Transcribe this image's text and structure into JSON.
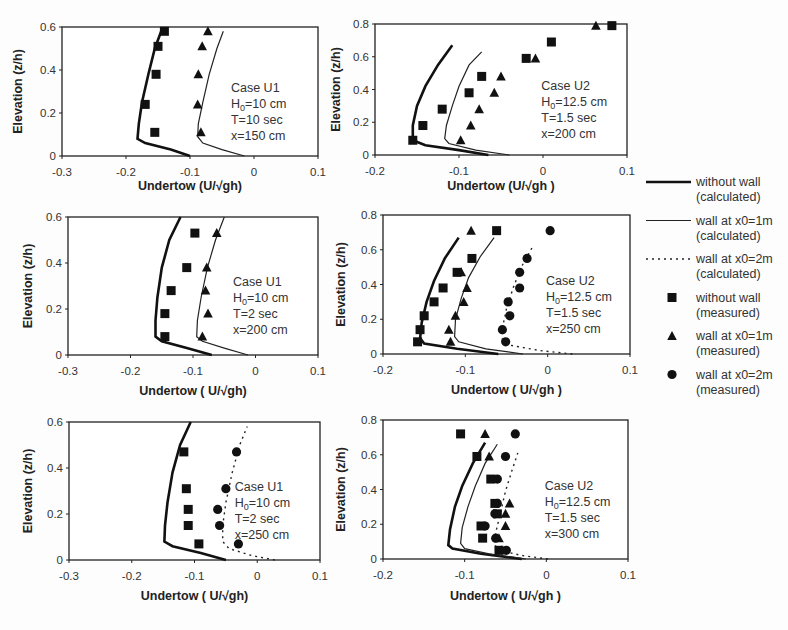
{
  "legend": {
    "items": [
      {
        "label1": "without wall",
        "label2": "(calculated)",
        "style": "thick-line"
      },
      {
        "label1": "wall at x0=1m",
        "label2": "(calculated)",
        "style": "thin-line"
      },
      {
        "label1": "wall at x0=2m",
        "label2": "(calculated)",
        "style": "dotted-line"
      },
      {
        "label1": "without wall",
        "label2": "(measured)",
        "style": "square"
      },
      {
        "label1": "wall at x0=1m",
        "label2": "(measured)",
        "style": "triangle"
      },
      {
        "label1": "wall at x0=2m",
        "label2": "(measured)",
        "style": "circle"
      }
    ]
  },
  "chart_data": [
    {
      "type": "scatter",
      "title": "",
      "annotation": [
        "Case U1",
        "H0=10 cm",
        "T=10 sec",
        "x=150 cm"
      ],
      "xlabel": "Undertow (U/√gh)",
      "ylabel": "Elevation (z/h)",
      "xlim": [
        -0.3,
        0.1
      ],
      "ylim": [
        0,
        0.6
      ],
      "xticks": [
        "-0.3",
        "-0.2",
        "-0.1",
        "0",
        "0.1"
      ],
      "yticks": [
        "0",
        "0.2",
        "0.4",
        "0.6"
      ],
      "series": [
        {
          "name": "without wall (calculated)",
          "style": "thick-line",
          "x": [
            -0.1,
            -0.13,
            -0.17,
            -0.182,
            -0.18,
            -0.175,
            -0.165,
            -0.155,
            -0.145
          ],
          "y": [
            0,
            0.03,
            0.06,
            0.08,
            0.15,
            0.25,
            0.38,
            0.5,
            0.58
          ]
        },
        {
          "name": "wall at x0=1m (calculated)",
          "style": "thin-line",
          "x": [
            -0.015,
            -0.05,
            -0.08,
            -0.088,
            -0.087,
            -0.08,
            -0.07,
            -0.058,
            -0.048
          ],
          "y": [
            0,
            0.03,
            0.06,
            0.09,
            0.15,
            0.25,
            0.38,
            0.5,
            0.58
          ]
        },
        {
          "name": "without wall (measured)",
          "style": "square",
          "x": [
            -0.155,
            -0.17,
            -0.153,
            -0.15,
            -0.14
          ],
          "y": [
            0.11,
            0.24,
            0.38,
            0.51,
            0.58
          ]
        },
        {
          "name": "wall at x0=1m (measured)",
          "style": "triangle",
          "x": [
            -0.083,
            -0.088,
            -0.087,
            -0.081,
            -0.072
          ],
          "y": [
            0.11,
            0.24,
            0.38,
            0.51,
            0.58
          ]
        }
      ]
    },
    {
      "type": "scatter",
      "title": "",
      "annotation": [
        "Case U2",
        "H0=12.5 cm",
        "T=1.5 sec",
        "x=200 cm"
      ],
      "xlabel": "Undertow (U/√gh )",
      "ylabel": "Elevation (z/h)",
      "xlim": [
        -0.2,
        0.1
      ],
      "ylim": [
        0,
        0.8
      ],
      "xticks": [
        "-0.2",
        "-0.1",
        "0",
        "0.1"
      ],
      "yticks": [
        "0",
        "0.2",
        "0.4",
        "0.6",
        "0.8"
      ],
      "series": [
        {
          "name": "without wall (calculated)",
          "style": "thick-line",
          "x": [
            -0.065,
            -0.1,
            -0.14,
            -0.155,
            -0.155,
            -0.15,
            -0.14,
            -0.125,
            -0.108
          ],
          "y": [
            0,
            0.03,
            0.06,
            0.09,
            0.18,
            0.3,
            0.42,
            0.55,
            0.67
          ]
        },
        {
          "name": "wall at x0=1m (calculated)",
          "style": "thin-line",
          "x": [
            -0.04,
            -0.08,
            -0.112,
            -0.117,
            -0.115,
            -0.108,
            -0.1,
            -0.088,
            -0.073
          ],
          "y": [
            0,
            0.03,
            0.07,
            0.1,
            0.18,
            0.3,
            0.42,
            0.55,
            0.63
          ]
        },
        {
          "name": "without wall (measured)",
          "style": "square",
          "x": [
            -0.155,
            -0.143,
            -0.12,
            -0.088,
            -0.073,
            -0.02,
            0.01,
            0.082
          ],
          "y": [
            0.09,
            0.18,
            0.28,
            0.38,
            0.48,
            0.59,
            0.69,
            0.79
          ]
        },
        {
          "name": "wall at x0=1m (measured)",
          "style": "triangle",
          "x": [
            -0.098,
            -0.086,
            -0.076,
            -0.058,
            -0.05,
            -0.009,
            0.063
          ],
          "y": [
            0.09,
            0.18,
            0.28,
            0.38,
            0.48,
            0.59,
            0.79
          ]
        }
      ]
    },
    {
      "type": "scatter",
      "title": "",
      "annotation": [
        "Case U1",
        "H0=10 cm",
        "T=2 sec",
        "x=200 cm"
      ],
      "xlabel": "Undertow ( U/√gh)",
      "ylabel": "Elevation (z/h)",
      "xlim": [
        -0.3,
        0.1
      ],
      "ylim": [
        0,
        0.6
      ],
      "xticks": [
        "-0.3",
        "-0.2",
        "-0.1",
        "0",
        "0.1"
      ],
      "yticks": [
        "0",
        "0.2",
        "0.4",
        "0.6"
      ],
      "series": [
        {
          "name": "without wall (calculated)",
          "style": "thick-line",
          "x": [
            -0.07,
            -0.11,
            -0.15,
            -0.16,
            -0.16,
            -0.157,
            -0.15,
            -0.138,
            -0.12
          ],
          "y": [
            0,
            0.03,
            0.06,
            0.08,
            0.15,
            0.25,
            0.38,
            0.5,
            0.6
          ]
        },
        {
          "name": "wall at x0=1m (calculated)",
          "style": "thin-line",
          "x": [
            -0.012,
            -0.05,
            -0.085,
            -0.094,
            -0.093,
            -0.087,
            -0.077,
            -0.064,
            -0.05
          ],
          "y": [
            0,
            0.03,
            0.06,
            0.08,
            0.15,
            0.25,
            0.38,
            0.5,
            0.6
          ]
        },
        {
          "name": "without wall (measured)",
          "style": "square",
          "x": [
            -0.145,
            -0.145,
            -0.135,
            -0.11,
            -0.097
          ],
          "y": [
            0.08,
            0.18,
            0.28,
            0.38,
            0.53
          ]
        },
        {
          "name": "wall at x0=1m (measured)",
          "style": "triangle",
          "x": [
            -0.085,
            -0.076,
            -0.08,
            -0.078,
            -0.062
          ],
          "y": [
            0.08,
            0.18,
            0.28,
            0.38,
            0.53
          ]
        }
      ]
    },
    {
      "type": "scatter",
      "title": "",
      "annotation": [
        "Case U2",
        "H0=12.5 cm",
        "T=1.5 sec",
        "x=250 cm"
      ],
      "xlabel": "Undertow ( U/√gh )",
      "ylabel": "Elevation (z/h)",
      "xlim": [
        -0.2,
        0.1
      ],
      "ylim": [
        0,
        0.8
      ],
      "xticks": [
        "-0.2",
        "-0.1",
        "0",
        "0.1"
      ],
      "yticks": [
        "0",
        "0.2",
        "0.4",
        "0.6",
        "0.8"
      ],
      "series": [
        {
          "name": "without wall (calculated)",
          "style": "thick-line",
          "x": [
            -0.06,
            -0.11,
            -0.15,
            -0.155,
            -0.153,
            -0.147,
            -0.138,
            -0.125,
            -0.108
          ],
          "y": [
            0,
            0.03,
            0.06,
            0.09,
            0.18,
            0.3,
            0.42,
            0.55,
            0.67
          ]
        },
        {
          "name": "wall at x0=1m (calculated)",
          "style": "thin-line",
          "x": [
            -0.03,
            -0.075,
            -0.108,
            -0.113,
            -0.112,
            -0.105,
            -0.096,
            -0.082,
            -0.065
          ],
          "y": [
            0,
            0.03,
            0.07,
            0.1,
            0.2,
            0.32,
            0.44,
            0.56,
            0.67
          ]
        },
        {
          "name": "wall at x0=2m (calculated)",
          "style": "dotted-line",
          "x": [
            0.03,
            -0.01,
            -0.045,
            -0.055,
            -0.055,
            -0.05,
            -0.042,
            -0.032,
            -0.018
          ],
          "y": [
            0,
            0.02,
            0.05,
            0.08,
            0.15,
            0.26,
            0.38,
            0.5,
            0.62
          ]
        },
        {
          "name": "without wall (measured)",
          "style": "square",
          "x": [
            -0.158,
            -0.155,
            -0.15,
            -0.138,
            -0.127,
            -0.11,
            -0.092,
            -0.062
          ],
          "y": [
            0.07,
            0.14,
            0.22,
            0.3,
            0.38,
            0.47,
            0.55,
            0.71
          ]
        },
        {
          "name": "wall at x0=1m (measured)",
          "style": "triangle",
          "x": [
            -0.118,
            -0.12,
            -0.112,
            -0.102,
            -0.098,
            -0.105,
            -0.093
          ],
          "y": [
            0.07,
            0.14,
            0.22,
            0.3,
            0.38,
            0.47,
            0.71
          ]
        },
        {
          "name": "wall at x0=2m (measured)",
          "style": "circle",
          "x": [
            -0.051,
            -0.055,
            -0.046,
            -0.048,
            -0.034,
            -0.034,
            -0.025,
            0.003
          ],
          "y": [
            0.07,
            0.14,
            0.22,
            0.3,
            0.38,
            0.47,
            0.55,
            0.71
          ]
        }
      ]
    },
    {
      "type": "scatter",
      "title": "",
      "annotation": [
        "Case U1",
        "H0=10 cm",
        "T=2 sec",
        "x=250 cm"
      ],
      "xlabel": "Undertow ( U/√gh)",
      "ylabel": "Elevation (z/h)",
      "xlim": [
        -0.3,
        0.1
      ],
      "ylim": [
        0,
        0.6
      ],
      "xticks": [
        "-0.3",
        "-0.2",
        "-0.1",
        "0",
        "0.1"
      ],
      "yticks": [
        "0",
        "0.2",
        "0.4",
        "0.6"
      ],
      "series": [
        {
          "name": "without wall (calculated)",
          "style": "thick-line",
          "x": [
            -0.05,
            -0.09,
            -0.135,
            -0.148,
            -0.147,
            -0.143,
            -0.135,
            -0.123,
            -0.106
          ],
          "y": [
            0,
            0.03,
            0.06,
            0.08,
            0.15,
            0.25,
            0.38,
            0.5,
            0.6
          ]
        },
        {
          "name": "wall at x0=2m (calculated)",
          "style": "dotted-line",
          "x": [
            0.028,
            -0.01,
            -0.045,
            -0.055,
            -0.055,
            -0.05,
            -0.04,
            -0.028,
            -0.016
          ],
          "y": [
            0,
            0.02,
            0.05,
            0.08,
            0.15,
            0.25,
            0.38,
            0.5,
            0.58
          ]
        },
        {
          "name": "without wall (measured)",
          "style": "square",
          "x": [
            -0.093,
            -0.11,
            -0.11,
            -0.113,
            -0.117
          ],
          "y": [
            0.07,
            0.15,
            0.22,
            0.31,
            0.47
          ]
        },
        {
          "name": "wall at x0=2m (measured)",
          "style": "circle",
          "x": [
            -0.03,
            -0.06,
            -0.063,
            -0.05,
            -0.033
          ],
          "y": [
            0.07,
            0.15,
            0.22,
            0.31,
            0.47
          ]
        }
      ]
    },
    {
      "type": "scatter",
      "title": "",
      "annotation": [
        "Case U2",
        "H0=12.5 cm",
        "T=1.5 sec",
        "x=300 cm"
      ],
      "xlabel": "Undertow ( U/√gh )",
      "ylabel": "Elevation (z/h)",
      "xlim": [
        -0.2,
        0.1
      ],
      "ylim": [
        0,
        0.8
      ],
      "xticks": [
        "-0.2",
        "-0.1",
        "0",
        "0.1"
      ],
      "yticks": [
        "0",
        "0.2",
        "0.4",
        "0.6",
        "0.8"
      ],
      "series": [
        {
          "name": "without wall (calculated)",
          "style": "thick-line",
          "x": [
            -0.03,
            -0.08,
            -0.115,
            -0.12,
            -0.118,
            -0.112,
            -0.103,
            -0.09,
            -0.075
          ],
          "y": [
            0,
            0.03,
            0.06,
            0.08,
            0.17,
            0.3,
            0.42,
            0.55,
            0.67
          ]
        },
        {
          "name": "wall at x0=1m (calculated)",
          "style": "thin-line",
          "x": [
            -0.025,
            -0.07,
            -0.1,
            -0.105,
            -0.103,
            -0.096,
            -0.087,
            -0.075,
            -0.06
          ],
          "y": [
            0,
            0.03,
            0.06,
            0.09,
            0.18,
            0.3,
            0.42,
            0.55,
            0.66
          ]
        },
        {
          "name": "wall at x0=2m (calculated)",
          "style": "dotted-line",
          "x": [
            0.002,
            -0.03,
            -0.058,
            -0.063,
            -0.062,
            -0.056,
            -0.05,
            -0.042,
            -0.035
          ],
          "y": [
            0,
            0.02,
            0.05,
            0.08,
            0.15,
            0.27,
            0.39,
            0.51,
            0.61
          ]
        },
        {
          "name": "without wall (measured)",
          "style": "square",
          "x": [
            -0.058,
            -0.078,
            -0.08,
            -0.06,
            -0.063,
            -0.068,
            -0.085,
            -0.105
          ],
          "y": [
            0.05,
            0.12,
            0.19,
            0.26,
            0.32,
            0.46,
            0.59,
            0.72
          ]
        },
        {
          "name": "wall at x0=1m (measured)",
          "style": "triangle",
          "x": [
            -0.055,
            -0.058,
            -0.05,
            -0.05,
            -0.045,
            -0.07,
            -0.075
          ],
          "y": [
            0.05,
            0.12,
            0.19,
            0.26,
            0.32,
            0.59,
            0.72
          ]
        },
        {
          "name": "wall at x0=2m (measured)",
          "style": "circle",
          "x": [
            -0.049,
            -0.062,
            -0.075,
            -0.063,
            -0.06,
            -0.06,
            -0.05,
            -0.038
          ],
          "y": [
            0.05,
            0.12,
            0.19,
            0.26,
            0.32,
            0.46,
            0.59,
            0.72
          ]
        }
      ]
    }
  ]
}
